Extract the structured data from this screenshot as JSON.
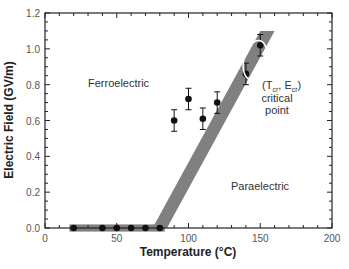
{
  "chart_data": {
    "type": "scatter",
    "title": "",
    "xlabel": "Temperature (°C)",
    "ylabel": "Electric Field (GV/m)",
    "xlim": [
      0,
      200
    ],
    "ylim": [
      0,
      1.2
    ],
    "x_ticks": [
      0,
      50,
      100,
      150,
      200
    ],
    "y_ticks": [
      0.0,
      0.2,
      0.4,
      0.6,
      0.8,
      1.0,
      1.2
    ],
    "x_tick_labels": [
      "0",
      "50",
      "100",
      "150",
      "200"
    ],
    "y_tick_labels": [
      "0.0",
      "0.2",
      "0.4",
      "0.6",
      "0.8",
      "1.0",
      "1.2"
    ],
    "grid": false,
    "series": [
      {
        "name": "measured",
        "marker": "filled-circle",
        "x": [
          20,
          40,
          50,
          60,
          70,
          80,
          90,
          100,
          110,
          120,
          140,
          150
        ],
        "y": [
          0.0,
          0.0,
          0.0,
          0.0,
          0.0,
          0.0,
          0.6,
          0.72,
          0.61,
          0.7,
          0.86,
          1.02
        ],
        "yerr": [
          0,
          0,
          0,
          0,
          0,
          0,
          0.06,
          0.06,
          0.06,
          0.06,
          0.06,
          0.06
        ]
      }
    ],
    "phase_boundary_band": {
      "color": "#808080",
      "segments": [
        {
          "x": [
            17,
            80
          ],
          "y": [
            0.0,
            0.0
          ],
          "half_width_y": 0.02
        },
        {
          "x": [
            80,
            155
          ],
          "y": [
            0.0,
            1.1
          ],
          "half_width_x": 5
        }
      ]
    },
    "annotations": [
      {
        "text": "Ferroelectric",
        "x": 40,
        "y": 0.8
      },
      {
        "text": "Paraelectric",
        "x": 160,
        "y": 0.38
      },
      {
        "text": "(T_cr, E_cr)",
        "x": 160,
        "y": 0.8
      },
      {
        "text": "critical",
        "x": 160,
        "y": 0.71
      },
      {
        "text": "point",
        "x": 160,
        "y": 0.64
      }
    ],
    "critical_point_ellipse": {
      "x": 146,
      "y": 0.94
    }
  },
  "labels": {
    "ferro": "Ferroelectric",
    "para": "Paraelectric",
    "cp_T": "T",
    "cp_Tsub": "cr",
    "cp_E": "E",
    "cp_Esub": "cr",
    "critical": "critical",
    "point": "point"
  }
}
